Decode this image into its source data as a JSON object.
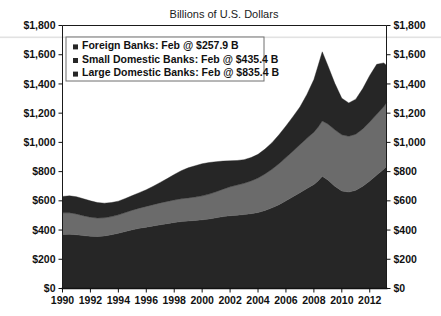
{
  "chart_data": {
    "type": "area",
    "stacked": true,
    "title": "Billions of U.S. Dollars",
    "xlabel": "",
    "ylabel": "",
    "ylim": [
      0,
      1800
    ],
    "ytick_step": 200,
    "grid": false,
    "legend_position": "top-left-inside",
    "ytick_labels": [
      "$0",
      "$200",
      "$400",
      "$600",
      "$800",
      "$1,000",
      "$1,200",
      "$1,400",
      "$1,600",
      "$1,800"
    ],
    "ytick_values": [
      0,
      200,
      400,
      600,
      800,
      1000,
      1200,
      1400,
      1600,
      1800
    ],
    "xtick_labels": [
      "1990",
      "1992",
      "1994",
      "1996",
      "1998",
      "2000",
      "2002",
      "2004",
      "2006",
      "2008",
      "2010",
      "2012"
    ],
    "xtick_values": [
      1990,
      1992,
      1994,
      1996,
      1998,
      2000,
      2002,
      2004,
      2006,
      2008,
      2010,
      2012
    ],
    "xlim": [
      1990,
      2013.2
    ],
    "x": [
      1990,
      1990.5,
      1991,
      1991.5,
      1992,
      1992.5,
      1993,
      1993.5,
      1994,
      1994.5,
      1995,
      1995.5,
      1996,
      1996.5,
      1997,
      1997.5,
      1998,
      1998.5,
      1999,
      1999.5,
      2000,
      2000.5,
      2001,
      2001.5,
      2002,
      2002.5,
      2003,
      2003.5,
      2004,
      2004.5,
      2005,
      2005.5,
      2006,
      2006.5,
      2007,
      2007.5,
      2008,
      2008.3,
      2008.6,
      2009,
      2009.5,
      2010,
      2010.5,
      2011,
      2011.5,
      2012,
      2012.5,
      2013,
      2013.2
    ],
    "series": [
      {
        "name": "Large Domestic Banks",
        "color": "#262626",
        "label": "Large Domestic Banks: Feb @ $835.4 B",
        "latest_value": 835.4,
        "latest_period": "Feb",
        "values": [
          370,
          372,
          368,
          362,
          358,
          356,
          360,
          368,
          378,
          390,
          402,
          412,
          420,
          428,
          436,
          444,
          452,
          458,
          462,
          466,
          470,
          476,
          484,
          492,
          498,
          502,
          506,
          512,
          520,
          534,
          552,
          574,
          600,
          628,
          656,
          684,
          712,
          736,
          768,
          742,
          700,
          668,
          660,
          672,
          700,
          736,
          776,
          816,
          835.4
        ]
      },
      {
        "name": "Small Domestic Banks",
        "color": "#6b6b6b",
        "label": "Small Domestic Banks: Feb @ $435.4 B",
        "latest_value": 435.4,
        "latest_period": "Feb",
        "values": [
          148,
          146,
          142,
          136,
          130,
          126,
          124,
          124,
          126,
          130,
          134,
          138,
          142,
          146,
          150,
          152,
          154,
          156,
          158,
          160,
          164,
          170,
          178,
          188,
          198,
          206,
          214,
          224,
          236,
          250,
          264,
          280,
          296,
          312,
          328,
          344,
          358,
          368,
          378,
          384,
          386,
          384,
          382,
          384,
          392,
          404,
          416,
          428,
          435.4
        ]
      },
      {
        "name": "Foreign Banks",
        "color": "#262626",
        "label": "Foreign Banks: Feb @ $257.9 B",
        "latest_value": 257.9,
        "latest_period": "Feb",
        "values": [
          112,
          116,
          118,
          116,
          112,
          106,
          100,
          96,
          94,
          96,
          100,
          106,
          114,
          126,
          140,
          156,
          174,
          192,
          206,
          214,
          220,
          216,
          206,
          192,
          178,
          168,
          162,
          160,
          162,
          170,
          182,
          198,
          216,
          236,
          258,
          300,
          360,
          420,
          474,
          400,
          318,
          250,
          228,
          240,
          276,
          318,
          342,
          300,
          258
        ]
      }
    ],
    "legend_entries": [
      {
        "label": "Foreign Banks: Feb @ $257.9 B",
        "marker_color": "#262626"
      },
      {
        "label": "Small Domestic Banks: Feb @ $435.4 B",
        "marker_color": "#262626"
      },
      {
        "label": "Large Domestic Banks: Feb @ $835.4 B",
        "marker_color": "#262626"
      }
    ]
  }
}
